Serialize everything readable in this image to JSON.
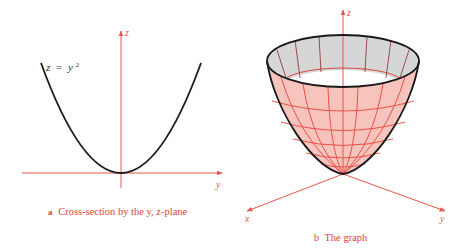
{
  "colors": {
    "axis": "#e8544a",
    "curve": "#1a1a1a",
    "surface_fill": "#f6c3bd",
    "interior_fill": "#d6d6d6",
    "grid_lines": "#e8443a",
    "caption": "#e0413a"
  },
  "panel_a": {
    "axis_z_label": "z",
    "axis_y_label": "y",
    "equation": {
      "lhs": "z",
      "eq": "=",
      "base": "y",
      "exp": "2"
    },
    "caption": {
      "letter": "a",
      "text": "Cross-section by the  y,  z-plane"
    }
  },
  "panel_b": {
    "axis_z_label": "z",
    "axis_x_label": "x",
    "axis_y_label": "y",
    "caption": {
      "letter": "b",
      "text": "The graph"
    }
  }
}
